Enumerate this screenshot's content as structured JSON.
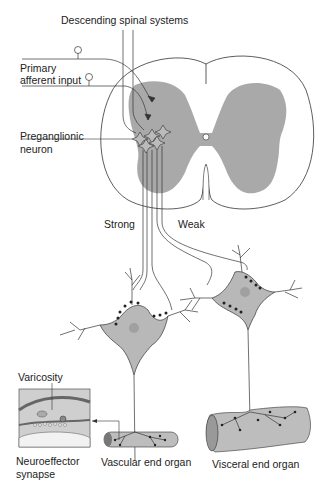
{
  "labels": {
    "descending": "Descending spinal systems",
    "primary_line1": "Primary",
    "primary_line2": "afferent input",
    "preganglionic_line1": "Preganglionic",
    "preganglionic_line2": "neuron",
    "strong": "Strong",
    "weak": "Weak",
    "varicosity": "Varicosity",
    "neuroeffector_line1": "Neuroeffector",
    "neuroeffector_line2": "synapse",
    "vascular": "Vascular end organ",
    "visceral": "Visceral end organ"
  },
  "colors": {
    "gray_matter": "#a9a9a9",
    "neuron_body": "#b8b8b8",
    "organ": "#bdbdbd",
    "line": "#333333",
    "bouton": "#222222"
  }
}
